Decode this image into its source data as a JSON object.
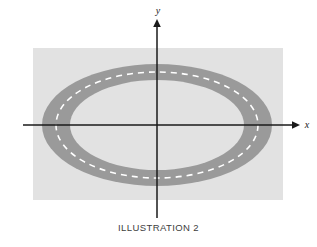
{
  "figure": {
    "caption": "ILLUSTRATION 2",
    "background_color": "#ffffff",
    "panel": {
      "name": "light-grey-backdrop",
      "color": "#e2e2e2",
      "x": 33,
      "y": 48,
      "width": 250,
      "height": 152
    },
    "axes": {
      "x_label": "x",
      "y_label": "y",
      "color": "#1a1a1a",
      "origin_x": 157,
      "origin_y": 125,
      "x_start": 23,
      "x_end": 300,
      "y_start": 19,
      "y_end": 218
    },
    "track": {
      "name": "elliptical-annulus",
      "band_color": "#9a9a9a",
      "inner_fill_color": "#e2e2e2",
      "center_x": 157,
      "center_y": 125,
      "outer_rx": 115,
      "outer_ry": 61,
      "inner_rx": 87,
      "inner_ry": 45,
      "centerline": {
        "name": "white-dashed-centerline",
        "color": "#ffffff",
        "rx": 101,
        "ry": 53,
        "dash": "6 5",
        "width": 1.6
      }
    }
  }
}
